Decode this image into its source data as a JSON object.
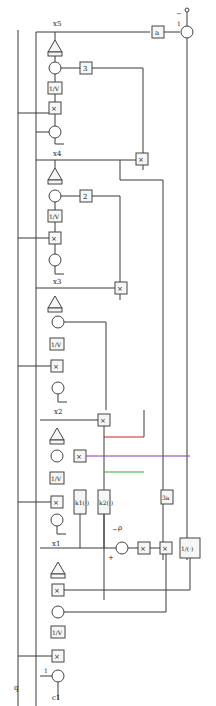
{
  "diagram": {
    "orientation": "rotated-90",
    "states": [
      "x1",
      "x2",
      "x3",
      "x4",
      "x5"
    ],
    "inputs": {
      "q": "q",
      "c1": "c1",
      "rho": "ρ",
      "rho_sign": "−",
      "ref_sign": "−",
      "ref_port": "1"
    },
    "blocks": {
      "integrator": "1/V",
      "multiply": "×",
      "gain_a": "a",
      "gain_3": "3",
      "gain_2": "2",
      "gain_3a": "3a",
      "k1": "k1(·)",
      "k2": "k2(·)",
      "reciprocal": "1/(·)",
      "sat": "⊓"
    },
    "signs": {
      "minus": "−",
      "plus": "+",
      "one": "1"
    },
    "labels": {
      "x1": "x1",
      "x2": "x2",
      "x3": "x3",
      "x4": "x4",
      "x5": "x5",
      "q": "q",
      "c1": "c1",
      "rho": "ρ"
    },
    "colors": {
      "line": "#3a3a3a",
      "accent_blue": "#3a3ab0",
      "accent_red": "#cc2222",
      "accent_green": "#33aa33",
      "accent_violet": "#7a3ab8"
    }
  }
}
